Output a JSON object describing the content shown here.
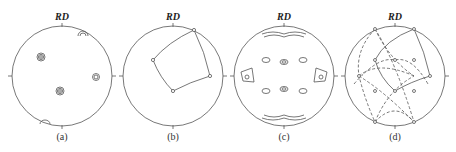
{
  "figure": {
    "axis_label": "RD",
    "panels": [
      {
        "id": "a",
        "caption": "(a)",
        "type": "pole-figure-contours",
        "cx": 62
      },
      {
        "id": "b",
        "caption": "(b)",
        "type": "ideal-orientation-quadrilateral",
        "cx": 173
      },
      {
        "id": "c",
        "caption": "(c)",
        "type": "pole-figure-contours",
        "cx": 284
      },
      {
        "id": "d",
        "caption": "(d)",
        "type": "ideal-orientation-overlay",
        "cx": 395
      }
    ],
    "colors": {
      "line": "#555555",
      "text": "#222222",
      "background": "#ffffff"
    }
  }
}
